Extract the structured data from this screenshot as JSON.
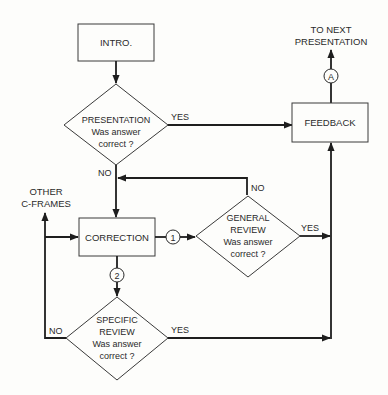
{
  "diagram": {
    "type": "flowchart",
    "nodes": {
      "intro": {
        "label": "INTRO."
      },
      "presentation": {
        "line1": "PRESENTATION",
        "line2": "Was answer",
        "line3": "correct ?"
      },
      "feedback": {
        "label": "FEEDBACK"
      },
      "correction": {
        "label": "CORRECTION"
      },
      "general_review": {
        "line1": "GENERAL",
        "line2": "REVIEW",
        "line3": "Was answer",
        "line4": "correct ?"
      },
      "specific_review": {
        "line1": "SPECIFIC",
        "line2": "REVIEW",
        "line3": "Was answer",
        "line4": "correct ?"
      }
    },
    "terminals": {
      "next_presentation": {
        "line1": "TO NEXT",
        "line2": "PRESENTATION"
      },
      "other_cframes": {
        "line1": "OTHER",
        "line2": "C-FRAMES"
      }
    },
    "connectors": {
      "a": "A",
      "one": "1",
      "two": "2"
    },
    "edge_labels": {
      "presentation_yes": "YES",
      "presentation_no": "NO",
      "general_yes": "YES",
      "general_no": "NO",
      "specific_yes": "YES",
      "specific_no": "NO"
    },
    "edges": [
      {
        "from": "INTRO.",
        "to": "PRESENTATION"
      },
      {
        "from": "PRESENTATION",
        "to": "FEEDBACK",
        "label": "YES"
      },
      {
        "from": "PRESENTATION",
        "to": "CORRECTION",
        "label": "NO"
      },
      {
        "from": "CORRECTION",
        "to": "GENERAL REVIEW",
        "via": "1"
      },
      {
        "from": "GENERAL REVIEW",
        "to": "CORRECTION",
        "label": "NO"
      },
      {
        "from": "GENERAL REVIEW",
        "to": "FEEDBACK",
        "label": "YES"
      },
      {
        "from": "CORRECTION",
        "to": "SPECIFIC REVIEW",
        "via": "2"
      },
      {
        "from": "SPECIFIC REVIEW",
        "to": "FEEDBACK",
        "label": "YES"
      },
      {
        "from": "SPECIFIC REVIEW",
        "to": "OTHER C-FRAMES",
        "label": "NO"
      },
      {
        "from": "SPECIFIC REVIEW",
        "to": "CORRECTION",
        "label": "NO"
      },
      {
        "from": "FEEDBACK",
        "to": "TO NEXT PRESENTATION",
        "via": "A"
      }
    ]
  }
}
